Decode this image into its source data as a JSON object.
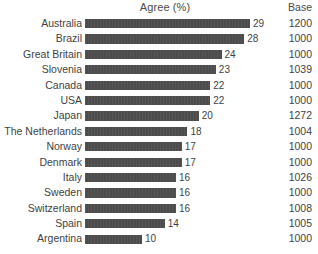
{
  "header": {
    "title": "Agree (%)",
    "base_label": "Base"
  },
  "colors": {
    "bar": "#4c4c4c",
    "text": "#3f3f3f",
    "background": "#ffffff"
  },
  "chart_data": {
    "type": "bar",
    "orientation": "horizontal",
    "title": "Agree (%)",
    "xlabel": "Agree (%)",
    "ylabel": "",
    "grid": false,
    "legend": false,
    "xlim": [
      0,
      30
    ],
    "categories": [
      "Australia",
      "Brazil",
      "Great Britain",
      "Slovenia",
      "Canada",
      "USA",
      "Japan",
      "The Netherlands",
      "Norway",
      "Denmark",
      "Italy",
      "Sweden",
      "Switzerland",
      "Spain",
      "Argentina"
    ],
    "values": [
      29,
      28,
      24,
      23,
      22,
      22,
      20,
      18,
      17,
      17,
      16,
      16,
      16,
      14,
      10
    ],
    "value_labels": [
      "29",
      "28",
      "24",
      "23",
      "22",
      "22",
      "20",
      "18",
      "17",
      "17",
      "16",
      "16",
      "16",
      "14",
      "10"
    ],
    "base_column_label": "Base",
    "base_values": [
      "1200",
      "1000",
      "1000",
      "1039",
      "1000",
      "1000",
      "1272",
      "1004",
      "1000",
      "1000",
      "1026",
      "1000",
      "1008",
      "1005",
      "1000"
    ]
  },
  "rows": [
    {
      "category": "Australia",
      "value": 29,
      "value_label": "29",
      "base": "1200"
    },
    {
      "category": "Brazil",
      "value": 28,
      "value_label": "28",
      "base": "1000"
    },
    {
      "category": "Great Britain",
      "value": 24,
      "value_label": "24",
      "base": "1000"
    },
    {
      "category": "Slovenia",
      "value": 23,
      "value_label": "23",
      "base": "1039"
    },
    {
      "category": "Canada",
      "value": 22,
      "value_label": "22",
      "base": "1000"
    },
    {
      "category": "USA",
      "value": 22,
      "value_label": "22",
      "base": "1000"
    },
    {
      "category": "Japan",
      "value": 20,
      "value_label": "20",
      "base": "1272"
    },
    {
      "category": "The Netherlands",
      "value": 18,
      "value_label": "18",
      "base": "1004"
    },
    {
      "category": "Norway",
      "value": 17,
      "value_label": "17",
      "base": "1000"
    },
    {
      "category": "Denmark",
      "value": 17,
      "value_label": "17",
      "base": "1000"
    },
    {
      "category": "Italy",
      "value": 16,
      "value_label": "16",
      "base": "1026"
    },
    {
      "category": "Sweden",
      "value": 16,
      "value_label": "16",
      "base": "1000"
    },
    {
      "category": "Switzerland",
      "value": 16,
      "value_label": "16",
      "base": "1008"
    },
    {
      "category": "Spain",
      "value": 14,
      "value_label": "14",
      "base": "1005"
    },
    {
      "category": "Argentina",
      "value": 10,
      "value_label": "10",
      "base": "1000"
    }
  ]
}
